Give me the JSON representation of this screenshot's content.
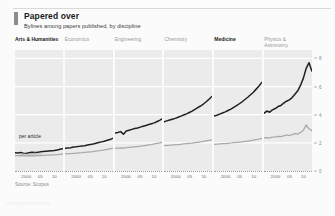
{
  "header": {
    "title": "Papered over",
    "subtitle": "Bylines among papers published, by discipline",
    "marker_color": "#8c8c8c"
  },
  "footer": {
    "source": "Source: Scopus",
    "watermark": "tradingeconomics"
  },
  "annotations": {
    "per_article": "per article",
    "per_author": "per author"
  },
  "axis": {
    "y_ticks": [
      "8",
      "6",
      "4",
      "2",
      "0"
    ],
    "x_ticks": [
      "2000",
      "05",
      "10"
    ],
    "y_range": [
      0,
      8.6
    ],
    "x_range": [
      1996,
      2013
    ]
  },
  "colors": {
    "per_article": "#231f20",
    "per_author": "#a9a9a9",
    "panel_bg": "#ebebeb",
    "gridline": "#ffffff",
    "axis_text": "#8a8a8a",
    "title_text": "#1a1a1a"
  },
  "chart_data": {
    "type": "line",
    "title": "Papered over",
    "subtitle": "Bylines among papers published, by discipline",
    "xlabel": "",
    "ylabel": "",
    "ylim": [
      0,
      8.6
    ],
    "xlim": [
      1996,
      2013
    ],
    "grid": true,
    "legend_position": "inline-first-panel",
    "y_ticks": [
      0,
      2,
      4,
      6,
      8
    ],
    "x_ticks": [
      2000,
      2005,
      2010
    ],
    "x": [
      1996,
      1997,
      1998,
      1999,
      2000,
      2001,
      2002,
      2003,
      2004,
      2005,
      2006,
      2007,
      2008,
      2009,
      2010,
      2011,
      2012,
      2013
    ],
    "panels": [
      {
        "name": "Arts & Humanities",
        "highlight": true,
        "series": [
          {
            "name": "per article",
            "values": [
              1.3,
              1.28,
              1.32,
              1.27,
              1.24,
              1.3,
              1.34,
              1.31,
              1.33,
              1.36,
              1.38,
              1.4,
              1.42,
              1.44,
              1.46,
              1.5,
              1.54,
              1.58
            ]
          },
          {
            "name": "per author",
            "values": [
              1.1,
              1.09,
              1.1,
              1.08,
              1.07,
              1.08,
              1.09,
              1.08,
              1.09,
              1.1,
              1.11,
              1.12,
              1.13,
              1.14,
              1.15,
              1.17,
              1.19,
              1.21
            ]
          }
        ]
      },
      {
        "name": "Economics",
        "highlight": false,
        "series": [
          {
            "name": "per article",
            "values": [
              1.62,
              1.64,
              1.66,
              1.7,
              1.72,
              1.75,
              1.78,
              1.8,
              1.84,
              1.88,
              1.92,
              1.97,
              2.02,
              2.07,
              2.12,
              2.18,
              2.24,
              2.32
            ]
          },
          {
            "name": "per author",
            "values": [
              1.22,
              1.23,
              1.24,
              1.26,
              1.27,
              1.29,
              1.3,
              1.32,
              1.34,
              1.36,
              1.38,
              1.41,
              1.44,
              1.47,
              1.5,
              1.54,
              1.58,
              1.62
            ]
          }
        ]
      },
      {
        "name": "Engineering",
        "highlight": false,
        "series": [
          {
            "name": "per article",
            "values": [
              2.7,
              2.74,
              2.8,
              2.62,
              2.84,
              2.9,
              2.96,
              3.02,
              3.06,
              3.12,
              3.18,
              3.24,
              3.3,
              3.36,
              3.42,
              3.52,
              3.62,
              3.74
            ]
          },
          {
            "name": "per author",
            "values": [
              1.6,
              1.62,
              1.64,
              1.62,
              1.66,
              1.68,
              1.7,
              1.72,
              1.74,
              1.76,
              1.79,
              1.82,
              1.85,
              1.88,
              1.92,
              1.96,
              2.0,
              2.06
            ]
          }
        ]
      },
      {
        "name": "Chemistry",
        "highlight": false,
        "series": [
          {
            "name": "per article",
            "values": [
              3.5,
              3.56,
              3.62,
              3.68,
              3.74,
              3.82,
              3.9,
              3.98,
              4.06,
              4.16,
              4.26,
              4.38,
              4.5,
              4.62,
              4.76,
              4.92,
              5.1,
              5.3
            ]
          },
          {
            "name": "per author",
            "values": [
              1.8,
              1.82,
              1.83,
              1.85,
              1.86,
              1.88,
              1.9,
              1.92,
              1.94,
              1.96,
              1.98,
              2.01,
              2.04,
              2.07,
              2.1,
              2.14,
              2.18,
              2.22
            ]
          }
        ]
      },
      {
        "name": "Medicine",
        "highlight": true,
        "series": [
          {
            "name": "per article",
            "values": [
              3.9,
              3.96,
              4.04,
              4.12,
              4.2,
              4.3,
              4.4,
              4.52,
              4.64,
              4.78,
              4.92,
              5.08,
              5.24,
              5.42,
              5.6,
              5.82,
              6.04,
              6.3
            ]
          },
          {
            "name": "per author",
            "values": [
              1.9,
              1.91,
              1.92,
              1.94,
              1.95,
              1.97,
              1.99,
              2.01,
              2.03,
              2.05,
              2.07,
              2.1,
              2.13,
              2.16,
              2.19,
              2.23,
              2.27,
              2.32
            ]
          }
        ]
      },
      {
        "name": "Physics &\nAstronomy",
        "highlight": false,
        "series": [
          {
            "name": "per article",
            "values": [
              4.1,
              4.26,
              4.18,
              4.34,
              4.44,
              4.58,
              4.66,
              4.82,
              4.96,
              5.06,
              5.22,
              5.46,
              5.7,
              6.1,
              6.6,
              7.3,
              7.7,
              7.1
            ]
          },
          {
            "name": "per author",
            "values": [
              2.35,
              2.38,
              2.36,
              2.4,
              2.42,
              2.46,
              2.44,
              2.5,
              2.56,
              2.52,
              2.58,
              2.66,
              2.62,
              2.74,
              2.9,
              3.28,
              3.0,
              2.86
            ]
          }
        ]
      }
    ]
  }
}
